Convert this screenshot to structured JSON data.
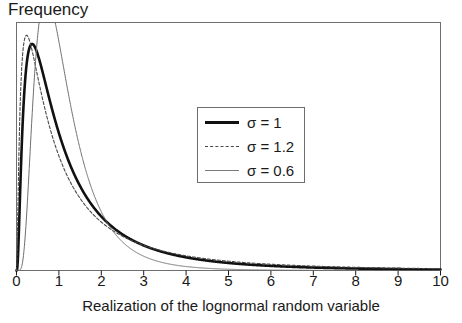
{
  "chart_data": {
    "type": "line",
    "title": "",
    "ylabel": "Frequency",
    "xlabel": "Realization of the lognormal random variable",
    "xlim": [
      0,
      10
    ],
    "ylim": [
      0,
      0.72
    ],
    "xticks": [
      "0",
      "1",
      "2",
      "3",
      "4",
      "5",
      "6",
      "7",
      "8",
      "9",
      "10"
    ],
    "yticks": [],
    "grid": false,
    "legend_position": "center",
    "distribution": "lognormal",
    "mu": 0,
    "series": [
      {
        "name": "sigma-1",
        "label": "σ = 1",
        "sigma": 1,
        "style": "solid-thick",
        "color": "#111111",
        "width": 2.6,
        "dash": "",
        "peak_x": 0.37,
        "peak_y": 0.6577
      },
      {
        "name": "sigma-1-2",
        "label": "σ = 1.2",
        "sigma": 1.2,
        "style": "dashed",
        "color": "#4a4a4a",
        "width": 1.1,
        "dash": "3,2",
        "peak_x": 0.2369,
        "peak_y": 0.6875
      },
      {
        "name": "sigma-0-6",
        "label": "σ = 0.6",
        "sigma": 0.6,
        "style": "solid-thin",
        "color": "#6e6e6e",
        "width": 1.0,
        "dash": "",
        "peak_x": 0.6977,
        "peak_y": 0.7094
      }
    ]
  },
  "axes": {
    "y_title": "Frequency",
    "x_title": "Realization of the lognormal random variable",
    "tick_labels": [
      "0",
      "1",
      "2",
      "3",
      "4",
      "5",
      "6",
      "7",
      "8",
      "9",
      "10"
    ],
    "frame_color": "#6e6e6e"
  },
  "legend": {
    "entries": [
      {
        "label": "σ = 1"
      },
      {
        "label": "σ = 1.2"
      },
      {
        "label": "σ = 0.6"
      }
    ]
  }
}
